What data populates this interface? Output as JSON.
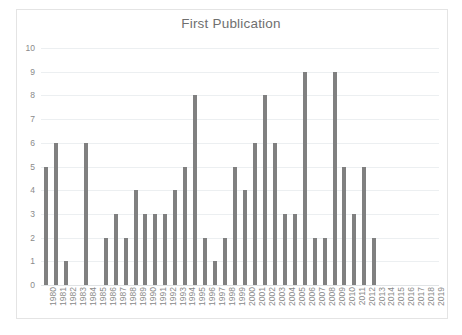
{
  "chart_data": {
    "type": "bar",
    "title": "First Publication",
    "xlabel": "",
    "ylabel": "",
    "ylim": [
      0,
      10
    ],
    "ytick_labels": [
      "0",
      "1",
      "2",
      "3",
      "4",
      "5",
      "6",
      "7",
      "8",
      "9",
      "10"
    ],
    "ytick_values": [
      0,
      1,
      2,
      3,
      4,
      5,
      6,
      7,
      8,
      9,
      10
    ],
    "grid": true,
    "legend": "none",
    "bar_color": "#808080",
    "gridline_color": "#eceff1",
    "categories": [
      "1980",
      "1981",
      "1982",
      "1983",
      "1984",
      "1985",
      "1986",
      "1987",
      "1988",
      "1989",
      "1990",
      "1991",
      "1992",
      "1993",
      "1994",
      "1995",
      "1996",
      "1997",
      "1998",
      "1999",
      "2000",
      "2001",
      "2002",
      "2003",
      "2004",
      "2005",
      "2006",
      "2007",
      "2008",
      "2009",
      "2010",
      "2011",
      "2012",
      "2013",
      "2014",
      "2015",
      "2016",
      "2017",
      "2018",
      "2019"
    ],
    "values": [
      5,
      6,
      1,
      0,
      6,
      0,
      2,
      3,
      2,
      4,
      3,
      3,
      3,
      4,
      5,
      8,
      2,
      1,
      2,
      5,
      4,
      6,
      8,
      6,
      3,
      3,
      9,
      2,
      2,
      9,
      5,
      3,
      5,
      2,
      0,
      0,
      0,
      0,
      0,
      0
    ]
  }
}
